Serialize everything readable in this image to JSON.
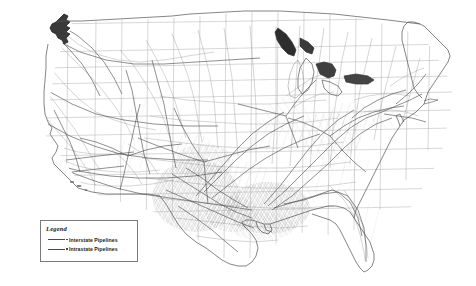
{
  "map": {
    "title": "United States Natural Gas Pipeline Network",
    "region": "Contiguous United States",
    "background_color": "#ffffff",
    "state_border_color": "#b5b5b5",
    "coastline_color": "#555555",
    "interstate_color": "#4a4a4a",
    "intrastate_color": "#9a9a9a"
  },
  "legend": {
    "title": "Legend",
    "items": [
      {
        "label": "Interstate Pipelines",
        "swatch": "solid-line-dot",
        "color": "#4a4a4a"
      },
      {
        "label": "Intrastate Pipelines",
        "swatch": "solid-line-dot",
        "color": "#4a4a4a"
      }
    ]
  },
  "density_regions": [
    {
      "name": "Gulf Coast / Louisiana",
      "density": "very-high"
    },
    {
      "name": "Texas",
      "density": "very-high"
    },
    {
      "name": "Oklahoma / Kansas",
      "density": "high"
    },
    {
      "name": "Appalachian / Ohio Valley",
      "density": "high"
    },
    {
      "name": "Great Lakes / Midwest",
      "density": "medium"
    },
    {
      "name": "Northeast Corridor",
      "density": "medium"
    },
    {
      "name": "Southeast / Florida",
      "density": "medium"
    },
    {
      "name": "Rocky Mountains",
      "density": "low"
    },
    {
      "name": "Pacific Northwest",
      "density": "low"
    },
    {
      "name": "Great Basin / Nevada",
      "density": "low"
    }
  ]
}
